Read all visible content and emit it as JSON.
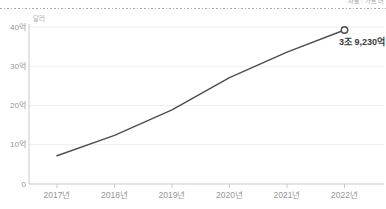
{
  "header": {
    "source_note": "자료: 가트너"
  },
  "chart_data": {
    "type": "line",
    "title": "",
    "unit": "달러",
    "x": [
      "2017년",
      "2018년",
      "2019년",
      "2020년",
      "2021년",
      "2022년"
    ],
    "values": [
      7.2,
      12.4,
      18.9,
      27.1,
      33.6,
      39.23
    ],
    "ytick_labels": [
      "0",
      "10억",
      "20억",
      "30억",
      "40억"
    ],
    "ytick_values": [
      0,
      10,
      20,
      30,
      40
    ],
    "ylim": [
      0,
      40
    ],
    "grid": true,
    "legend": "none",
    "end_annotation": "3조 9,230억",
    "colors": {
      "line": "#4d4d4d",
      "marker_fill": "#ffffff",
      "axis": "#c9c9c9",
      "grid": "#ededed",
      "tick_label": "#969696",
      "unit_label": "#ababab",
      "annotation": "#3b3b3b",
      "divider": "#a8a8a8",
      "source_note": "#9a9a9a"
    }
  }
}
